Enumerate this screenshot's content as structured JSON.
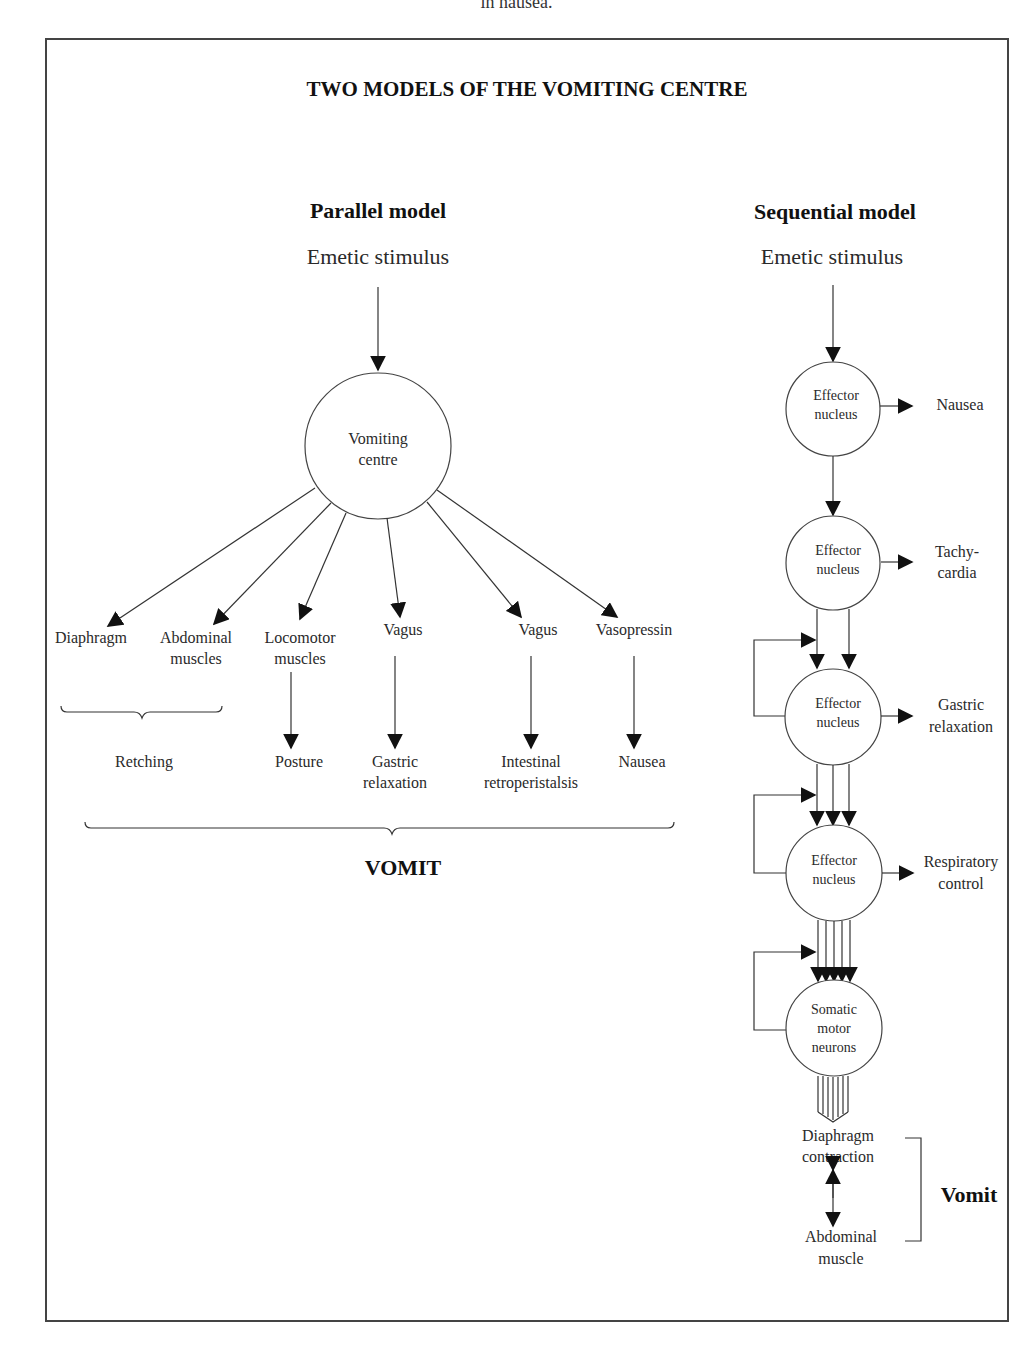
{
  "caption_cutoff": "in nausea.",
  "figure": {
    "title": "TWO MODELS OF THE VOMITING CENTRE",
    "parallel": {
      "heading": "Parallel model",
      "stimulus": "Emetic stimulus",
      "centre": [
        "Vomiting",
        "centre"
      ],
      "targets": [
        {
          "label": [
            "Diaphragm"
          ]
        },
        {
          "label": [
            "Abdominal",
            "muscles"
          ]
        },
        {
          "label": [
            "Locomotor",
            "muscles"
          ]
        },
        {
          "label": [
            "Vagus"
          ]
        },
        {
          "label": [
            "Vagus"
          ]
        },
        {
          "label": [
            "Vasopressin"
          ]
        }
      ],
      "outcomes": [
        {
          "label": [
            "Retching"
          ]
        },
        {
          "label": [
            "Posture"
          ]
        },
        {
          "label": [
            "Gastric",
            "relaxation"
          ]
        },
        {
          "label": [
            "Intestinal",
            "retroperistalsis"
          ]
        },
        {
          "label": [
            "Nausea"
          ]
        }
      ],
      "result": "VOMIT"
    },
    "sequential": {
      "heading": "Sequential model",
      "stimulus": "Emetic stimulus",
      "nodes": [
        {
          "label": [
            "Effector",
            "nucleus"
          ],
          "output": [
            "Nausea"
          ]
        },
        {
          "label": [
            "Effector",
            "nucleus"
          ],
          "output": [
            "Tachy-",
            "cardia"
          ]
        },
        {
          "label": [
            "Effector",
            "nucleus"
          ],
          "output": [
            "Gastric",
            "relaxation"
          ]
        },
        {
          "label": [
            "Effector",
            "nucleus"
          ],
          "output": [
            "Respiratory",
            "control"
          ]
        },
        {
          "label": [
            "Somatic",
            "motor",
            "neurons"
          ]
        }
      ],
      "final_top": [
        "Diaphragm",
        "contraction"
      ],
      "final_bottom": [
        "Abdominal",
        "muscle"
      ],
      "result": "Vomit"
    }
  }
}
